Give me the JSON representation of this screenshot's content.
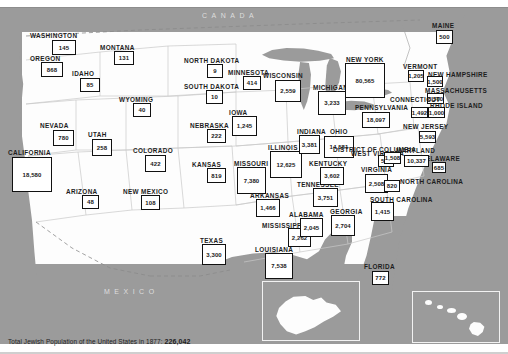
{
  "figure": {
    "title": "Jewish Population of the United States in 1877",
    "canada_label": "CANADA",
    "mexico_label": "MEXICO"
  },
  "caption": {
    "lead": "Total Jewish Population of the United States in",
    "year": "1877:",
    "total": "226,042"
  },
  "chart_data": {
    "type": "map",
    "title": "Total Jewish Population of the United States in 1877: 226,042",
    "value_label": "Jewish population, 1877",
    "total": 226042,
    "categories": [
      "WASHINGTON",
      "OREGON",
      "IDAHO",
      "MONTANA",
      "NORTH DAKOTA",
      "SOUTH DAKOTA",
      "MINNESOTA",
      "WISCONSIN",
      "MICHIGAN",
      "WYOMING",
      "NEVADA",
      "CALIFORNIA",
      "UTAH",
      "COLORADO",
      "NEBRASKA",
      "IOWA",
      "KANSAS",
      "MISSOURI",
      "ILLINOIS",
      "INDIANA",
      "OHIO",
      "ARIZONA",
      "NEW MEXICO",
      "TEXAS",
      "ARKANSAS",
      "LOUISIANA",
      "MISSISSIPPI",
      "ALABAMA",
      "TENNESSEE",
      "KENTUCKY",
      "WEST VIRGINIA",
      "VIRGINIA",
      "NORTH CAROLINA",
      "SOUTH CAROLINA",
      "GEORGIA",
      "FLORIDA",
      "NEW YORK",
      "PENNSYLVANIA",
      "MAINE",
      "VERMONT",
      "NEW HAMPSHIRE",
      "MASSACHUSETTS",
      "RHODE ISLAND",
      "CONNECTICUT",
      "NEW JERSEY",
      "DELAWARE",
      "MARYLAND",
      "DISTRICT OF COLUMBIA"
    ],
    "values": [
      145,
      868,
      85,
      131,
      9,
      10,
      414,
      2559,
      3233,
      40,
      780,
      18580,
      258,
      422,
      222,
      1245,
      819,
      7380,
      12625,
      3381,
      14581,
      48,
      108,
      3300,
      1466,
      7538,
      2262,
      2045,
      3751,
      3602,
      511,
      2508,
      820,
      1415,
      2704,
      772,
      80565,
      18097,
      500,
      1205,
      1500,
      8500,
      1000,
      1492,
      5593,
      685,
      10337,
      1508
    ]
  },
  "states": [
    {
      "name": "WASHINGTON",
      "value": "145",
      "nx": 30,
      "ny": 32,
      "bx": 52,
      "by": 40,
      "bw": 24,
      "bh": 15
    },
    {
      "name": "OREGON",
      "value": "868",
      "nx": 30,
      "ny": 55,
      "bx": 41,
      "by": 62,
      "bw": 22,
      "bh": 15
    },
    {
      "name": "IDAHO",
      "value": "85",
      "nx": 72,
      "ny": 70,
      "bx": 80,
      "by": 78,
      "bw": 20,
      "bh": 14
    },
    {
      "name": "MONTANA",
      "value": "131",
      "nx": 100,
      "ny": 44,
      "bx": 114,
      "by": 51,
      "bw": 20,
      "bh": 14
    },
    {
      "name": "NORTH DAKOTA",
      "value": "9",
      "nx": 184,
      "ny": 57,
      "bx": 207,
      "by": 64,
      "bw": 16,
      "bh": 14
    },
    {
      "name": "SOUTH DAKOTA",
      "value": "10",
      "nx": 184,
      "ny": 83,
      "bx": 206,
      "by": 90,
      "bw": 17,
      "bh": 14
    },
    {
      "name": "MINNESOTA",
      "value": "414",
      "nx": 228,
      "ny": 69,
      "bx": 243,
      "by": 76,
      "bw": 18,
      "bh": 14
    },
    {
      "name": "WISCONSIN",
      "value": "2,559",
      "nx": 263,
      "ny": 72,
      "bx": 275,
      "by": 80,
      "bw": 26,
      "bh": 22
    },
    {
      "name": "MICHIGAN",
      "value": "3,233",
      "nx": 313,
      "ny": 84,
      "bx": 318,
      "by": 91,
      "bw": 28,
      "bh": 24
    },
    {
      "name": "WYOMING",
      "value": "40",
      "nx": 119,
      "ny": 96,
      "bx": 133,
      "by": 103,
      "bw": 18,
      "bh": 14
    },
    {
      "name": "NEVADA",
      "value": "780",
      "nx": 40,
      "ny": 122,
      "bx": 53,
      "by": 130,
      "bw": 21,
      "bh": 16
    },
    {
      "name": "CALIFORNIA",
      "value": "18,580",
      "nx": 8,
      "ny": 149,
      "bx": 12,
      "by": 157,
      "bw": 40,
      "bh": 35
    },
    {
      "name": "UTAH",
      "value": "258",
      "nx": 88,
      "ny": 131,
      "bx": 92,
      "by": 139,
      "bw": 20,
      "bh": 17
    },
    {
      "name": "COLORADO",
      "value": "422",
      "nx": 133,
      "ny": 147,
      "bx": 145,
      "by": 155,
      "bw": 21,
      "bh": 17
    },
    {
      "name": "NEBRASKA",
      "value": "222",
      "nx": 190,
      "ny": 122,
      "bx": 207,
      "by": 129,
      "bw": 19,
      "bh": 14
    },
    {
      "name": "IOWA",
      "value": "1,245",
      "nx": 229,
      "ny": 109,
      "bx": 232,
      "by": 116,
      "bw": 25,
      "bh": 20
    },
    {
      "name": "KANSAS",
      "value": "819",
      "nx": 192,
      "ny": 161,
      "bx": 207,
      "by": 168,
      "bw": 19,
      "bh": 15
    },
    {
      "name": "MISSOURI",
      "value": "7,380",
      "nx": 234,
      "ny": 160,
      "bx": 237,
      "by": 167,
      "bw": 29,
      "bh": 27
    },
    {
      "name": "ILLINOIS",
      "value": "12,625",
      "nx": 268,
      "ny": 144,
      "bx": 270,
      "by": 151,
      "bw": 32,
      "bh": 27
    },
    {
      "name": "INDIANA",
      "value": "3,381",
      "nx": 297,
      "ny": 128,
      "bx": 299,
      "by": 135,
      "bw": 21,
      "bh": 19
    },
    {
      "name": "OHIO",
      "value": "14,581",
      "nx": 330,
      "ny": 128,
      "bx": 324,
      "by": 136,
      "bw": 30,
      "bh": 22
    },
    {
      "name": "ARIZONA",
      "value": "48",
      "nx": 66,
      "ny": 188,
      "bx": 82,
      "by": 195,
      "bw": 17,
      "bh": 14
    },
    {
      "name": "NEW MEXICO",
      "value": "108",
      "nx": 123,
      "ny": 188,
      "bx": 141,
      "by": 195,
      "bw": 19,
      "bh": 15
    },
    {
      "name": "TEXAS",
      "value": "3,300",
      "nx": 200,
      "ny": 237,
      "bx": 202,
      "by": 244,
      "bw": 24,
      "bh": 21
    },
    {
      "name": "ARKANSAS",
      "value": "1,466",
      "nx": 250,
      "ny": 192,
      "bx": 256,
      "by": 199,
      "bw": 24,
      "bh": 18
    },
    {
      "name": "LOUISIANA",
      "value": "7,538",
      "nx": 255,
      "ny": 246,
      "bx": 265,
      "by": 253,
      "bw": 28,
      "bh": 26
    },
    {
      "name": "MISSISSIPPI",
      "value": "2,262",
      "nx": 262,
      "ny": 222,
      "bx": 288,
      "by": 228,
      "bw": 23,
      "bh": 19
    },
    {
      "name": "ALABAMA",
      "value": "2,045",
      "nx": 289,
      "ny": 211,
      "bx": 300,
      "by": 218,
      "bw": 23,
      "bh": 19
    },
    {
      "name": "TENNESSEE",
      "value": "3,751",
      "nx": 297,
      "ny": 181,
      "bx": 313,
      "by": 188,
      "bw": 25,
      "bh": 19
    },
    {
      "name": "KENTUCKY",
      "value": "3,602",
      "nx": 309,
      "ny": 160,
      "bx": 320,
      "by": 167,
      "bw": 24,
      "bh": 18
    },
    {
      "name": "WEST VIRGINIA",
      "value": "511",
      "nx": 351,
      "ny": 150,
      "bx": 378,
      "by": 155,
      "bw": 16,
      "bh": 12
    },
    {
      "name": "VIRGINIA",
      "value": "2,508",
      "nx": 361,
      "ny": 166,
      "bx": 365,
      "by": 174,
      "bw": 23,
      "bh": 19
    },
    {
      "name": "NORTH CAROLINA",
      "value": "820",
      "nx": 400,
      "ny": 178,
      "bx": 384,
      "by": 180,
      "bw": 16,
      "bh": 12
    },
    {
      "name": "SOUTH CAROLINA",
      "value": "1,415",
      "nx": 370,
      "ny": 196,
      "bx": 371,
      "by": 202,
      "bw": 23,
      "bh": 19
    },
    {
      "name": "GEORGIA",
      "value": "2,704",
      "nx": 330,
      "ny": 208,
      "bx": 331,
      "by": 215,
      "bw": 24,
      "bh": 21
    },
    {
      "name": "FLORIDA",
      "value": "772",
      "nx": 364,
      "ny": 263,
      "bx": 372,
      "by": 271,
      "bw": 17,
      "bh": 14
    },
    {
      "name": "NEW YORK",
      "value": "80,565",
      "nx": 346,
      "ny": 56,
      "bx": 345,
      "by": 63,
      "bw": 40,
      "bh": 35
    },
    {
      "name": "PENNSYLVANIA",
      "value": "18,097",
      "nx": 355,
      "ny": 104,
      "bx": 362,
      "by": 112,
      "bw": 28,
      "bh": 16
    },
    {
      "name": "MAINE",
      "value": "500",
      "nx": 432,
      "ny": 22,
      "bx": 436,
      "by": 30,
      "bw": 17,
      "bh": 14
    },
    {
      "name": "VERMONT",
      "value": "1,205",
      "nx": 403,
      "ny": 63,
      "bx": 408,
      "by": 70,
      "bw": 16,
      "bh": 12
    },
    {
      "name": "NEW HAMPSHIRE",
      "value": "1,500",
      "nx": 428,
      "ny": 71,
      "bx": 427,
      "by": 76,
      "bw": 16,
      "bh": 11
    },
    {
      "name": "MASSACHUSETTS",
      "value": "8,500",
      "nx": 425,
      "ny": 87,
      "bx": 427,
      "by": 93,
      "bw": 17,
      "bh": 11
    },
    {
      "name": "RHODE ISLAND",
      "value": "1,000",
      "nx": 430,
      "ny": 102,
      "bx": 428,
      "by": 107,
      "bw": 17,
      "bh": 11
    },
    {
      "name": "CONNECTICUT",
      "value": "1,492",
      "nx": 390,
      "ny": 96,
      "bx": 411,
      "by": 107,
      "bw": 17,
      "bh": 11
    },
    {
      "name": "NEW JERSEY",
      "value": "5,593",
      "nx": 403,
      "ny": 123,
      "bx": 419,
      "by": 131,
      "bw": 17,
      "bh": 12
    },
    {
      "name": "DELAWARE",
      "value": "685",
      "nx": 421,
      "ny": 155,
      "bx": 432,
      "by": 162,
      "bw": 14,
      "bh": 11
    },
    {
      "name": "MARYLAND",
      "value": "10,337",
      "nx": 396,
      "ny": 147,
      "bx": 404,
      "by": 155,
      "bw": 25,
      "bh": 12
    },
    {
      "name": "DISTRICT OF COLUMBIA",
      "value": "1,508",
      "nx": 333,
      "ny": 146,
      "bx": 384,
      "by": 152,
      "bw": 17,
      "bh": 12
    }
  ],
  "insets": [
    {
      "name": "alaska-inset"
    },
    {
      "name": "hawaii-inset"
    }
  ]
}
